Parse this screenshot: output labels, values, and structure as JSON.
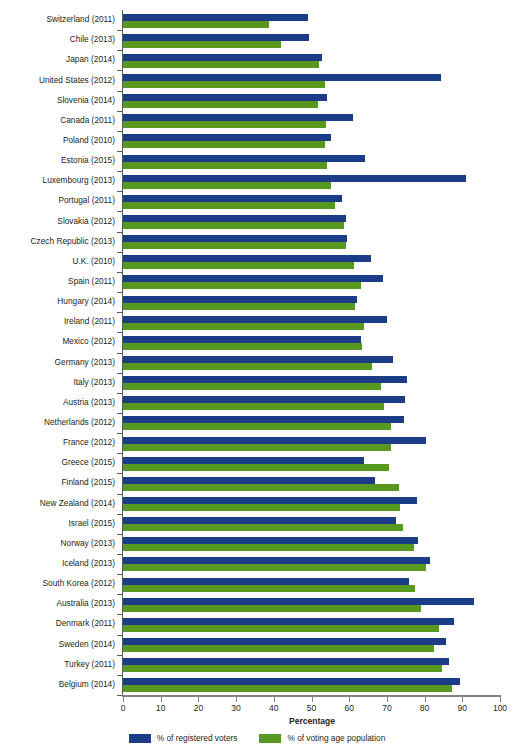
{
  "chart_data": {
    "type": "bar",
    "orientation": "horizontal",
    "title": "",
    "subtitle": "",
    "xlabel": "Percentage",
    "ylabel": "",
    "xlim": [
      0,
      100
    ],
    "xticks": [
      0,
      10,
      20,
      30,
      40,
      50,
      60,
      70,
      80,
      90,
      100
    ],
    "grid": false,
    "legend_position": "bottom",
    "categories": [
      "Switzerland (2011)",
      "Chile (2013)",
      "Japan (2014)",
      "United States (2012)",
      "Slovenia (2014)",
      "Canada (2011)",
      "Poland (2010)",
      "Estonia (2015)",
      "Luxembourg (2013)",
      "Portugal (2011)",
      "Slovakia (2012)",
      "Czech Republic (2013)",
      "U.K. (2010)",
      "Spain (2011)",
      "Hungary (2014)",
      "Ireland (2011)",
      "Mexico (2012)",
      "Germany (2013)",
      "Italy (2013)",
      "Austria (2013)",
      "Netherlands (2012)",
      "France (2012)",
      "Greece (2015)",
      "Finland (2015)",
      "New Zealand (2014)",
      "Israel (2015)",
      "Norway (2013)",
      "Iceland (2013)",
      "South Korea (2012)",
      "Australia (2013)",
      "Denmark (2011)",
      "Sweden (2014)",
      "Turkey (2011)",
      "Belgium (2014)"
    ],
    "series": [
      {
        "name": "% of registered voters",
        "color": "#1b3d87",
        "values": [
          49.0,
          49.4,
          52.7,
          84.3,
          54.1,
          61.1,
          55.3,
          64.2,
          91.1,
          58.0,
          59.1,
          59.5,
          65.8,
          68.9,
          62.0,
          69.9,
          63.1,
          71.5,
          75.2,
          74.9,
          74.6,
          80.3,
          63.9,
          66.9,
          77.9,
          72.3,
          78.2,
          81.4,
          75.8,
          93.0,
          87.7,
          85.8,
          86.4,
          89.4
        ]
      },
      {
        "name": "% of voting age population",
        "color": "#57981f",
        "values": [
          38.6,
          42.0,
          51.9,
          53.6,
          51.7,
          53.8,
          53.7,
          54.2,
          55.1,
          56.3,
          58.6,
          59.2,
          61.2,
          63.1,
          61.6,
          64.0,
          63.3,
          66.1,
          68.5,
          69.3,
          71.0,
          71.2,
          70.5,
          73.1,
          73.4,
          74.2,
          77.3,
          80.3,
          77.5,
          79.0,
          83.9,
          82.6,
          84.7,
          87.2
        ]
      }
    ]
  },
  "legend": {
    "items": [
      {
        "label": "% of registered voters",
        "color": "#1b3d87"
      },
      {
        "label": "% of voting age population",
        "color": "#57981f"
      }
    ]
  },
  "axis": {
    "x_title": "Percentage"
  },
  "colors": {
    "blue": "#1b3d87",
    "green": "#57981f",
    "axis": "#808285",
    "text": "#231f20",
    "background": "#ffffff"
  }
}
